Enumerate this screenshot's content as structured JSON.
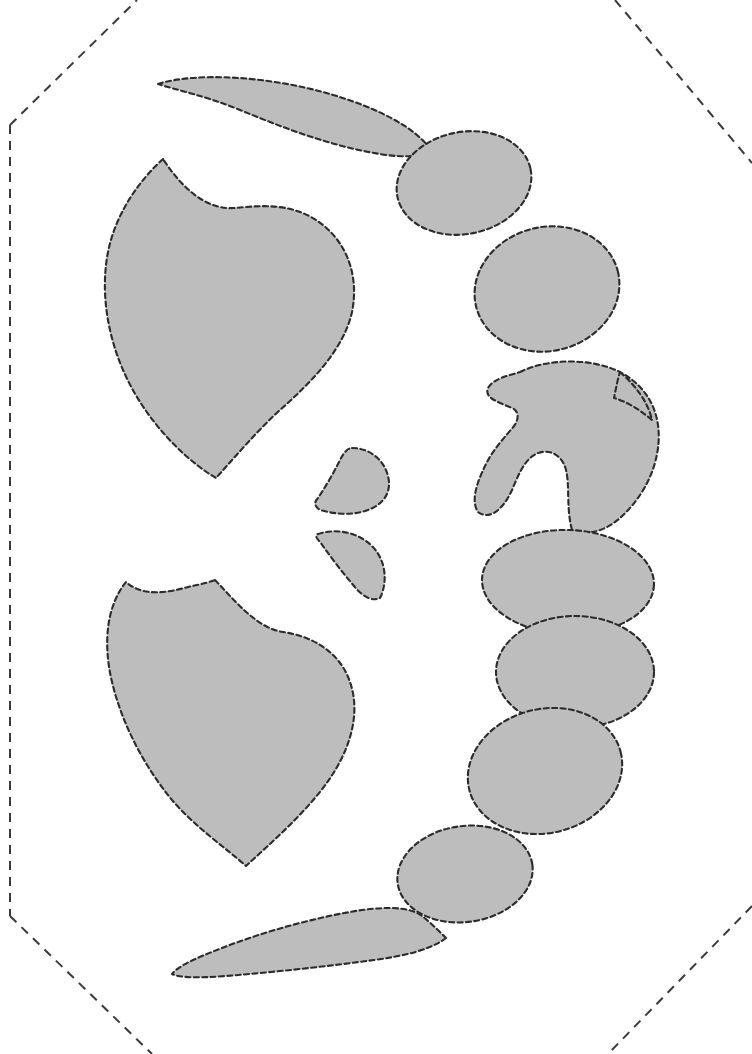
{
  "document": {
    "title": "Dashed-outline shape layout sheet",
    "background_color": "#FFFFFF",
    "width": 752,
    "height": 1054
  },
  "style": {
    "shape_fill": "#BDBDBD",
    "shape_stroke": "#2B2B2B",
    "shape_stroke_width": 2.1,
    "shape_dash": "5,3.4",
    "frame_stroke": "#3A3A3A",
    "frame_stroke_width": 2,
    "frame_dash": "9,7"
  },
  "frame": {
    "name": "octagonal-cut-frame",
    "segments": [
      {
        "name": "left-edge",
        "x1": 10,
        "y1": 125,
        "x2": 10,
        "y2": 916
      },
      {
        "name": "top-left-diagonal",
        "x1": 10,
        "y1": 125,
        "x2": 137,
        "y2": 0
      },
      {
        "name": "top-right-diagonal",
        "x1": 615,
        "y1": 0,
        "x2": 752,
        "y2": 163
      },
      {
        "name": "bottom-left-diagonal",
        "x1": 10,
        "y1": 916,
        "x2": 152,
        "y2": 1054
      },
      {
        "name": "bottom-right-diagonal",
        "x1": 752,
        "y1": 906,
        "x2": 608,
        "y2": 1054
      }
    ]
  },
  "shapes": [
    {
      "id": "top-crescent",
      "label": "Top curved crescent blade",
      "kind": "crescent",
      "bbox": [
        156,
        74,
        275,
        83
      ],
      "path": "M 158 84 C 196 72 268 76 330 94 C 378 108 416 128 430 149 C 424 157 404 158 380 154 C 330 146 284 128 240 110 C 206 96 176 90 158 84 Z"
    },
    {
      "id": "upper-left-leaf",
      "label": "Large upper-left leaf",
      "kind": "leaf",
      "bbox": [
        105,
        155,
        255,
        325
      ],
      "path": "M 163 159 C 140 180 116 212 108 252 C 99 298 110 350 134 392 C 158 434 192 464 216 478 C 236 456 256 432 280 410 C 314 380 344 348 352 312 C 360 272 344 238 316 220 C 288 202 258 206 234 208 C 206 210 182 188 163 159 Z"
    },
    {
      "id": "right-ellipse-1",
      "label": "Upper right ellipse",
      "kind": "ellipse",
      "cx": 464,
      "cy": 183,
      "rx": 68,
      "ry": 51,
      "rotation": -12
    },
    {
      "id": "right-ellipse-2",
      "label": "Second right ellipse",
      "kind": "ellipse",
      "cx": 547,
      "cy": 289,
      "rx": 73,
      "ry": 62,
      "rotation": -14
    },
    {
      "id": "right-double-lobe",
      "label": "Right double-lobed chevron shape",
      "kind": "lobed",
      "bbox": [
        490,
        358,
        175,
        180
      ],
      "path": "M 520 372 C 548 358 592 358 620 372 C 650 388 662 416 658 448 C 654 478 638 502 620 518 C 604 532 586 536 572 530 C 566 508 570 486 566 470 C 562 454 548 448 536 454 C 524 460 518 476 512 490 C 502 512 488 520 478 512 C 470 500 478 480 486 464 C 494 448 506 436 514 426 C 520 418 518 410 512 408 C 498 402 484 398 488 388 C 494 378 508 376 520 372 Z M 620 372 C 636 386 648 402 652 420 C 640 410 628 402 614 398 C 616 388 618 378 620 372 Z"
    },
    {
      "id": "small-teardrop",
      "label": "Small upper teardrop",
      "kind": "teardrop",
      "bbox": [
        312,
        444,
        78,
        74
      ],
      "path": "M 352 448 C 370 448 384 460 388 476 C 392 492 384 504 368 510 C 352 516 334 514 320 510 C 314 506 314 502 318 498 C 326 486 334 472 340 460 C 344 452 348 448 352 448 Z"
    },
    {
      "id": "small-crescent",
      "label": "Small lower crescent",
      "kind": "crescent",
      "bbox": [
        312,
        528,
        76,
        74
      ],
      "path": "M 318 534 C 336 528 358 532 372 546 C 386 560 388 582 380 598 C 372 602 362 596 354 586 C 342 572 330 556 320 542 C 316 538 315 535 318 534 Z"
    },
    {
      "id": "right-ellipse-3",
      "label": "Third right ellipse",
      "kind": "ellipse",
      "cx": 568,
      "cy": 582,
      "rx": 86,
      "ry": 52,
      "rotation": 2
    },
    {
      "id": "right-ellipse-4",
      "label": "Fourth right ellipse",
      "kind": "ellipse",
      "cx": 575,
      "cy": 672,
      "rx": 79,
      "ry": 56,
      "rotation": 0
    },
    {
      "id": "right-ellipse-5",
      "label": "Fifth right ellipse",
      "kind": "ellipse",
      "cx": 545,
      "cy": 771,
      "rx": 78,
      "ry": 62,
      "rotation": -14
    },
    {
      "id": "bottom-right-ellipse",
      "label": "Bottom right ellipse",
      "kind": "ellipse",
      "cx": 465,
      "cy": 874,
      "rx": 68,
      "ry": 48,
      "rotation": -8
    },
    {
      "id": "lower-left-leaf",
      "label": "Large lower-left leaf",
      "kind": "leaf",
      "bbox": [
        105,
        576,
        255,
        325
      ],
      "path": "M 215 580 C 236 602 257 628 283 632 C 312 636 340 652 350 682 C 362 716 348 754 326 784 C 304 814 272 842 246 866 C 226 848 196 828 172 800 C 144 766 122 724 112 682 C 102 640 108 604 126 582 C 144 598 170 592 192 586 C 202 584 210 582 215 580 Z"
    },
    {
      "id": "bottom-crescent",
      "label": "Bottom curved crescent blade",
      "kind": "crescent",
      "bbox": [
        168,
        905,
        280,
        76
      ],
      "path": "M 446 938 C 430 950 404 956 374 960 C 330 966 276 972 226 976 C 200 978 180 978 172 974 C 178 966 196 958 222 948 C 268 930 322 916 362 910 C 392 906 412 908 422 916 C 430 922 438 930 446 938 Z"
    }
  ]
}
